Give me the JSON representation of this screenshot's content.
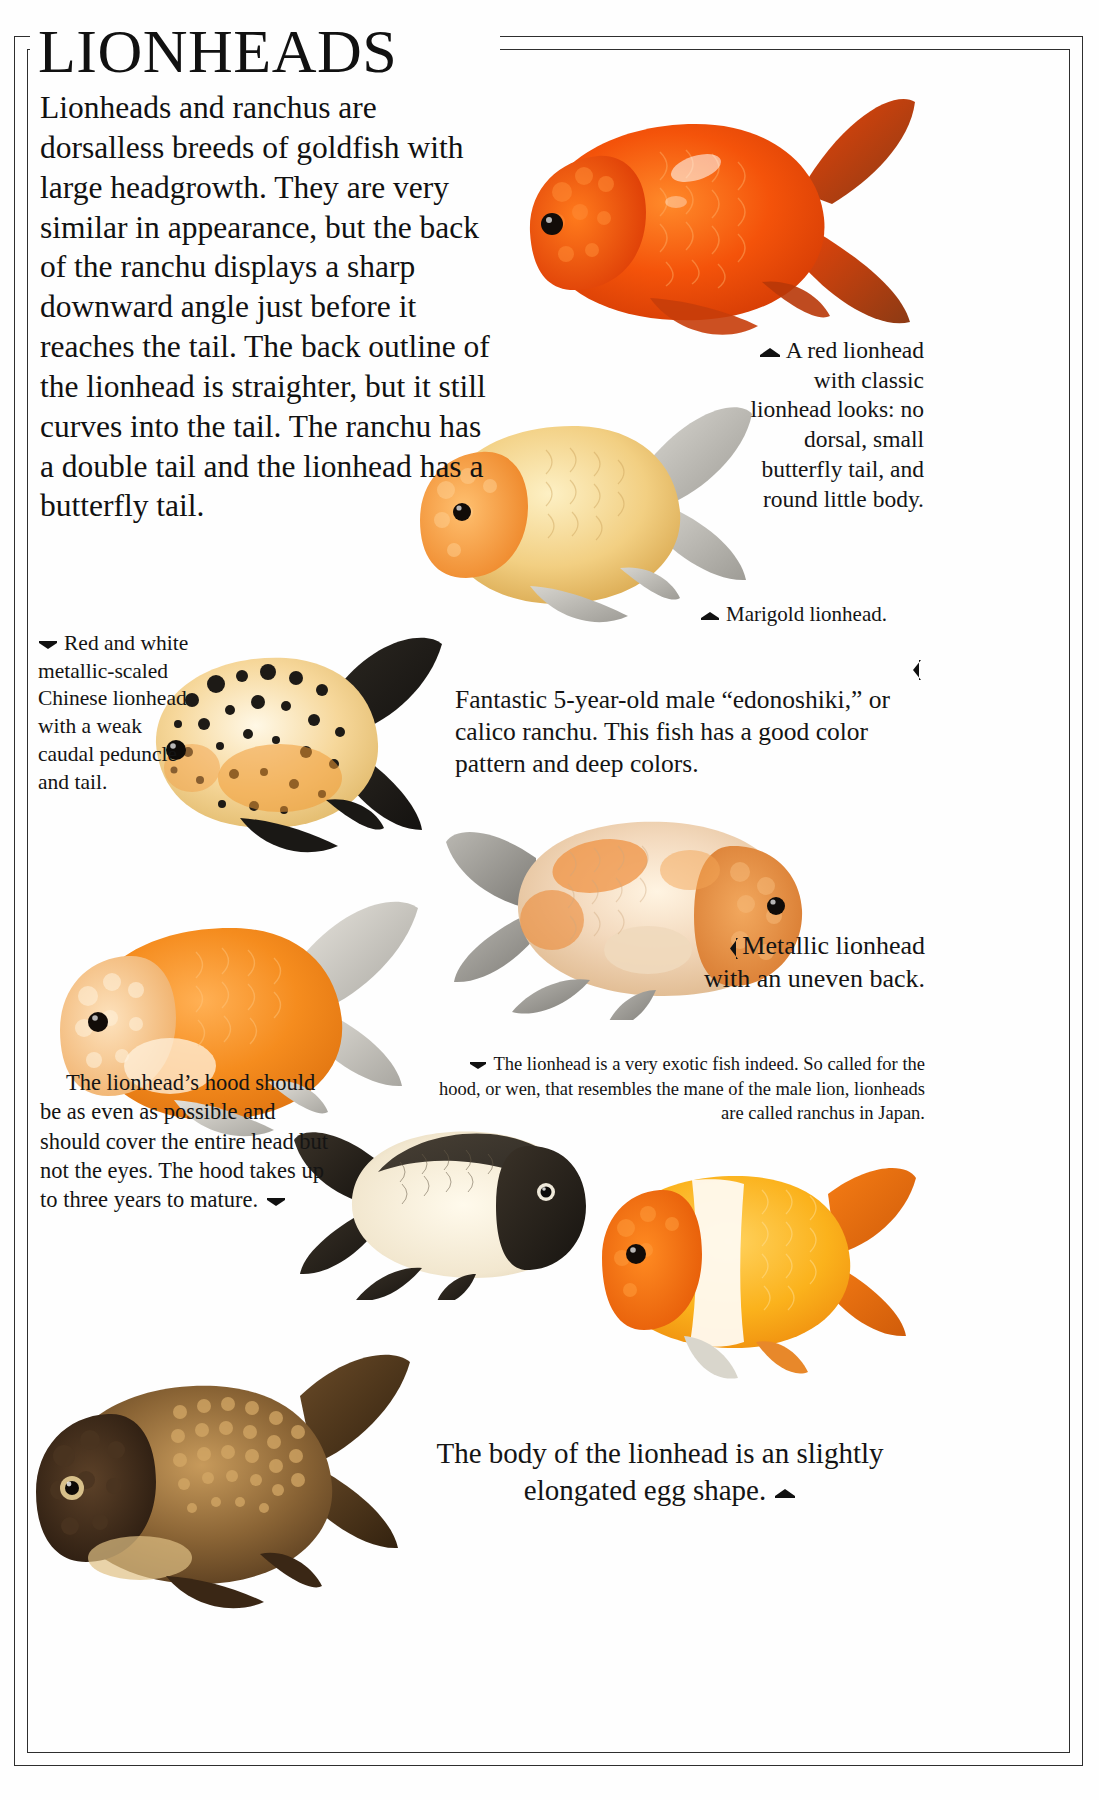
{
  "page": {
    "title": "LIONHEADS",
    "background_color": "#fefefe",
    "frame_color": "#2e2e2e"
  },
  "intro": {
    "text": "Lionheads and ranchus are dorsalless breeds of goldfish with large headgrowth. They are very similar in appearance, but the back of the ranchu displays a sharp downward angle just before it reaches the tail. The back outline of the lionhead is straighter, but it still curves into the tail. The ranchu has a double tail and the lionhead has a butterfly tail."
  },
  "captions": {
    "red_lionhead": {
      "marker": "left-pointing-triangle",
      "text": "A red lionhead with classic lionhead looks: no dorsal, small butterfly tail, and round little body."
    },
    "marigold": {
      "marker": "left-pointing-triangle",
      "text": "Marigold lionhead."
    },
    "calico_ranchu": {
      "marker": "left-pointing-triangle",
      "text": "Fantastic 5-year-old male “edonoshiki,” or calico ranchu. This fish has a good color pattern and deep colors."
    },
    "chinese_lionhead": {
      "marker": "right-pointing-triangle",
      "text": "Red and white metallic-scaled Chinese lionhead with a weak caudal peduncle and tail."
    },
    "metallic_lionhead": {
      "marker": "left-pointing-triangle",
      "text": "Metallic lionhead with an uneven back."
    },
    "exotic_note": {
      "marker": "right-pointing-triangle",
      "text": "The lionhead is a very exotic fish indeed. So called for the hood, or wen, that resembles the mane of the male lion, lionheads are called ranchus in Japan."
    },
    "hood": {
      "marker": "right-pointing-triangle",
      "text": "The lionhead’s hood should be as even as possible and should cover the entire head but not the eyes. The hood takes up to three years to mature."
    },
    "body_shape": {
      "marker": "up-pointing-triangle",
      "text": "The body of the lionhead is an slightly elongated egg shape."
    }
  },
  "photos": [
    {
      "name": "red-lionhead-photo",
      "label": "Red lionhead goldfish, right-facing",
      "primary_color": "#f2590f"
    },
    {
      "name": "marigold-lionhead-photo",
      "label": "Marigold lionhead goldfish, left-facing",
      "primary_color": "#e8a23a"
    },
    {
      "name": "chinese-lionhead-photo",
      "label": "Red and white calico Chinese lionhead, right-facing",
      "primary_color": "#f0c070"
    },
    {
      "name": "calico-ranchu-photo",
      "label": "Calico edonoshiki ranchu, right-facing",
      "primary_color": "#e8915a"
    },
    {
      "name": "orange-lionhead-photo",
      "label": "Orange and white lionhead, left-facing",
      "primary_color": "#f4902a"
    },
    {
      "name": "black-white-ranchu-photo",
      "label": "Black and white ranchu, right-facing",
      "primary_color": "#f2ead2"
    },
    {
      "name": "orange-white-lionhead-photo",
      "label": "Orange and white lionhead, right-facing",
      "primary_color": "#f98c18"
    },
    {
      "name": "bronze-lionhead-photo",
      "label": "Bronze chocolate lionhead, left-facing",
      "primary_color": "#6b4a2c"
    }
  ]
}
